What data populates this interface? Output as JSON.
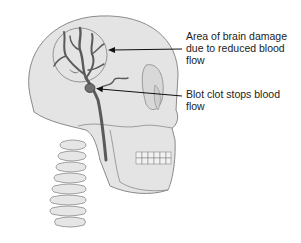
{
  "diagram": {
    "labels": [
      {
        "id": "damage",
        "text": "Area of brain damage due to reduced blood flow"
      },
      {
        "id": "clot",
        "text": "Blot clot stops blood flow"
      }
    ],
    "colors": {
      "skull_fill": "#e4e4e4",
      "skull_stroke": "#8a8a8a",
      "vessel": "#5a5a5a",
      "arrow": "#111111",
      "text": "#222222"
    }
  }
}
